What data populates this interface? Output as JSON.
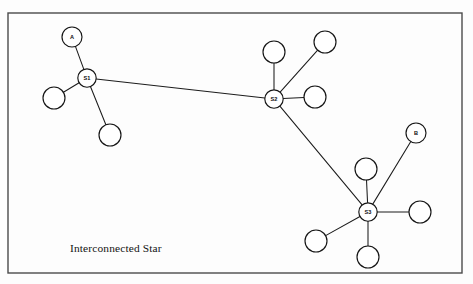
{
  "diagram": {
    "caption": "Interconnected Star",
    "caption_position": {
      "x": 70,
      "y": 252
    },
    "type": "network-topology",
    "colors": {
      "background": "#fdfdfd",
      "frame_stroke": "#4a4a4a",
      "edge_stroke": "#1c1c1c",
      "node_fill": "#ffffff",
      "node_stroke": "#151515",
      "text": "#131313"
    },
    "frame": {
      "x": 8,
      "y": 13,
      "width": 454,
      "height": 260
    },
    "nodes": [
      {
        "id": "A",
        "label": "A",
        "x": 72,
        "y": 37,
        "r": 10.0,
        "kind": "endpoint"
      },
      {
        "id": "S1",
        "label": "S1",
        "x": 87,
        "y": 78,
        "r": 9.2,
        "kind": "switch"
      },
      {
        "id": "S2",
        "label": "S2",
        "x": 274,
        "y": 99,
        "r": 9.2,
        "kind": "switch"
      },
      {
        "id": "S3",
        "label": "S3",
        "x": 368,
        "y": 212,
        "r": 9.2,
        "kind": "switch"
      },
      {
        "id": "B",
        "label": "B",
        "x": 416,
        "y": 133,
        "r": 10.0,
        "kind": "endpoint"
      },
      {
        "id": "n1",
        "label": "",
        "x": 54,
        "y": 98,
        "r": 11.0,
        "kind": "host"
      },
      {
        "id": "n2",
        "label": "",
        "x": 110,
        "y": 135,
        "r": 11.0,
        "kind": "host"
      },
      {
        "id": "n3",
        "label": "",
        "x": 274,
        "y": 52,
        "r": 11.0,
        "kind": "host"
      },
      {
        "id": "n4",
        "label": "",
        "x": 325,
        "y": 42,
        "r": 11.0,
        "kind": "host"
      },
      {
        "id": "n5",
        "label": "",
        "x": 315,
        "y": 97,
        "r": 11.0,
        "kind": "host"
      },
      {
        "id": "n6",
        "label": "",
        "x": 366,
        "y": 169,
        "r": 11.0,
        "kind": "host"
      },
      {
        "id": "n7",
        "label": "",
        "x": 420,
        "y": 212,
        "r": 11.0,
        "kind": "host"
      },
      {
        "id": "n8",
        "label": "",
        "x": 368,
        "y": 257,
        "r": 11.0,
        "kind": "host"
      },
      {
        "id": "n9",
        "label": "",
        "x": 316,
        "y": 241,
        "r": 11.0,
        "kind": "host"
      }
    ],
    "edges": [
      {
        "from": "A",
        "to": "S1"
      },
      {
        "from": "n1",
        "to": "S1"
      },
      {
        "from": "n2",
        "to": "S1"
      },
      {
        "from": "S1",
        "to": "S2"
      },
      {
        "from": "n3",
        "to": "S2"
      },
      {
        "from": "n4",
        "to": "S2"
      },
      {
        "from": "n5",
        "to": "S2"
      },
      {
        "from": "S2",
        "to": "S3"
      },
      {
        "from": "B",
        "to": "S3"
      },
      {
        "from": "n6",
        "to": "S3"
      },
      {
        "from": "n7",
        "to": "S3"
      },
      {
        "from": "n8",
        "to": "S3"
      },
      {
        "from": "n9",
        "to": "S3"
      }
    ]
  }
}
